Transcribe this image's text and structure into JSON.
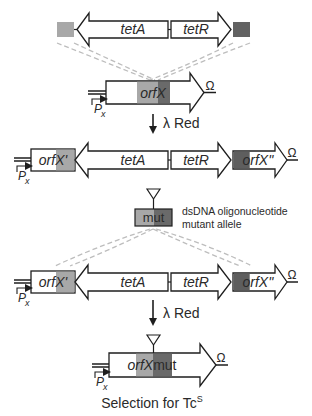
{
  "colors": {
    "light_homology": "#a8a8a8",
    "dark_homology": "#6a6a6a",
    "outline": "#1e1e1e",
    "dashed": "#bdbdbd",
    "background": "#ffffff"
  },
  "cassette": {
    "tetA_label": "tetA",
    "tetR_label": "tetR"
  },
  "target": {
    "gene_label": "orfX",
    "promoter_label": "P",
    "promoter_sub": "x",
    "terminator": "Ω"
  },
  "step1": {
    "arrow_label": "λ Red"
  },
  "intermediate": {
    "left_fragment": "orfX'",
    "right_fragment": "orfX''",
    "tetA_label": "tetA",
    "tetR_label": "tetR",
    "promoter_label": "P",
    "promoter_sub": "x",
    "terminator": "Ω"
  },
  "oligo": {
    "box_label": "mut",
    "description_line1": "dsDNA oligonucleotide",
    "description_line2": "mutant allele"
  },
  "intermediate2": {
    "left_fragment": "orfX'",
    "right_fragment": "orfX''",
    "tetA_label": "tetA",
    "tetR_label": "tetR",
    "promoter_label": "P",
    "promoter_sub": "x",
    "terminator": "Ω"
  },
  "step2": {
    "arrow_label": "λ Red"
  },
  "final": {
    "gene_label": "orfX",
    "mut_label": "mut",
    "promoter_label": "P",
    "promoter_sub": "x",
    "terminator": "Ω"
  },
  "caption": {
    "text": "Selection for Tc",
    "superscript": "S"
  }
}
